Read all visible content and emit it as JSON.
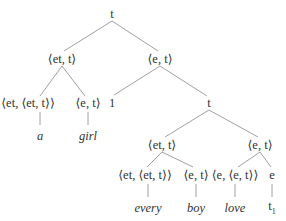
{
  "tree": {
    "nodes": [
      {
        "id": "root",
        "label": "t",
        "x": 112,
        "y": 14
      },
      {
        "id": "np",
        "label": "⟨et, t⟩",
        "x": 62,
        "y": 59
      },
      {
        "id": "lambda",
        "label": "⟨e, t⟩",
        "x": 160,
        "y": 59
      },
      {
        "id": "det-a",
        "label": "⟨et, ⟨et, t⟩⟩",
        "x": 28,
        "y": 103
      },
      {
        "id": "n-girl",
        "label": "⟨e, t⟩",
        "x": 88,
        "y": 103
      },
      {
        "id": "index",
        "label": "1",
        "x": 112,
        "y": 103
      },
      {
        "id": "s",
        "label": "t",
        "x": 209,
        "y": 103
      },
      {
        "id": "np2",
        "label": "⟨et, t⟩",
        "x": 162,
        "y": 145
      },
      {
        "id": "vp",
        "label": "⟨e, t⟩",
        "x": 260,
        "y": 145
      },
      {
        "id": "det-every",
        "label": "⟨et, ⟨et, t⟩⟩",
        "x": 145,
        "y": 175
      },
      {
        "id": "n-boy",
        "label": "⟨e, t⟩",
        "x": 196,
        "y": 175
      },
      {
        "id": "v-love",
        "label": "⟨e, ⟨e, t⟩⟩",
        "x": 235,
        "y": 175
      },
      {
        "id": "e-trace",
        "label": "e",
        "x": 272,
        "y": 175
      }
    ],
    "leaves": [
      {
        "id": "a",
        "label": "a",
        "x": 40,
        "y": 136
      },
      {
        "id": "girl",
        "label": "girl",
        "x": 88,
        "y": 136
      },
      {
        "id": "every",
        "label": "every",
        "x": 148,
        "y": 208
      },
      {
        "id": "boy",
        "label": "boy",
        "x": 196,
        "y": 208
      },
      {
        "id": "love",
        "label": "love",
        "x": 235,
        "y": 208
      }
    ],
    "trace": {
      "label": "t",
      "subscript": "1",
      "x": 272,
      "y": 208
    }
  }
}
